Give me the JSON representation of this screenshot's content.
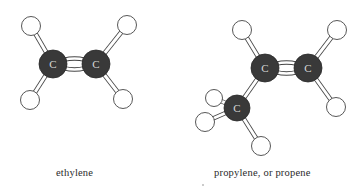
{
  "colors": {
    "background": "#ffffff",
    "carbon_fill": "#393939",
    "carbon_label": "#d8d8d8",
    "hydrogen_fill": "#ffffff",
    "outline": "#444444",
    "caption": "#2a2a2a"
  },
  "molecules": [
    {
      "name": "ethylene",
      "caption": "ethylene",
      "atoms": [
        {
          "id": "C1",
          "element": "C",
          "label": "C",
          "x": 53,
          "y": 64,
          "r": 14
        },
        {
          "id": "C2",
          "element": "C",
          "label": "C",
          "x": 96,
          "y": 64,
          "r": 14
        },
        {
          "id": "H1",
          "element": "H",
          "x": 31,
          "y": 26,
          "r": 9.5
        },
        {
          "id": "H2",
          "element": "H",
          "x": 30,
          "y": 100,
          "r": 9.5
        },
        {
          "id": "H3",
          "element": "H",
          "x": 127,
          "y": 25,
          "r": 9.5
        },
        {
          "id": "H4",
          "element": "H",
          "x": 123,
          "y": 99,
          "r": 9.5
        }
      ],
      "bonds": [
        {
          "from": "C1",
          "to": "C2",
          "type": "double"
        },
        {
          "from": "C1",
          "to": "H1",
          "type": "single"
        },
        {
          "from": "C1",
          "to": "H2",
          "type": "single"
        },
        {
          "from": "C2",
          "to": "H3",
          "type": "single"
        },
        {
          "from": "C2",
          "to": "H4",
          "type": "single"
        }
      ]
    },
    {
      "name": "propylene",
      "caption": "propylene, or propene",
      "atoms": [
        {
          "id": "C1",
          "element": "C",
          "label": "C",
          "x": 265,
          "y": 68,
          "r": 14
        },
        {
          "id": "C2",
          "element": "C",
          "label": "C",
          "x": 308,
          "y": 68,
          "r": 14
        },
        {
          "id": "C3",
          "element": "C",
          "label": "C",
          "x": 237,
          "y": 108,
          "r": 13
        },
        {
          "id": "H1",
          "element": "H",
          "x": 242,
          "y": 30,
          "r": 9.5
        },
        {
          "id": "H2",
          "element": "H",
          "x": 337,
          "y": 30,
          "r": 9.5
        },
        {
          "id": "H3",
          "element": "H",
          "x": 336,
          "y": 107,
          "r": 9.5
        },
        {
          "id": "H4",
          "element": "H",
          "x": 214,
          "y": 98,
          "r": 8.5
        },
        {
          "id": "H5",
          "element": "H",
          "x": 205,
          "y": 122,
          "r": 9.5
        },
        {
          "id": "H6",
          "element": "H",
          "x": 261,
          "y": 146,
          "r": 9.5
        }
      ],
      "bonds": [
        {
          "from": "C1",
          "to": "C2",
          "type": "double"
        },
        {
          "from": "C1",
          "to": "H1",
          "type": "single"
        },
        {
          "from": "C2",
          "to": "H2",
          "type": "single"
        },
        {
          "from": "C2",
          "to": "H3",
          "type": "single"
        },
        {
          "from": "C1",
          "to": "C3",
          "type": "single"
        },
        {
          "from": "C3",
          "to": "H4",
          "type": "single"
        },
        {
          "from": "C3",
          "to": "H5",
          "type": "single"
        },
        {
          "from": "C3",
          "to": "H6",
          "type": "single"
        }
      ]
    }
  ],
  "captions": {
    "ethylene": "ethylene",
    "propylene": "propylene, or propene"
  }
}
